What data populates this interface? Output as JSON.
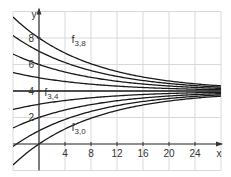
{
  "chart_data": {
    "type": "line",
    "title": "",
    "xlabel": "x",
    "ylabel": "y",
    "xlim": [
      -4,
      28
    ],
    "ylim": [
      -2,
      10
    ],
    "grid": true,
    "x_ticks": [
      4,
      8,
      12,
      16,
      20,
      24
    ],
    "y_ticks": [
      2,
      4,
      6,
      8
    ],
    "function_family": "f_{3,c}(x) = 4 + (c - 4) * exp(-x/12)",
    "series": [
      {
        "name": "f3,0",
        "c": 0
      },
      {
        "name": "f3,1",
        "c": 1
      },
      {
        "name": "f3,2",
        "c": 2
      },
      {
        "name": "f3,3",
        "c": 3
      },
      {
        "name": "f3,4",
        "c": 4
      },
      {
        "name": "f3,5",
        "c": 5
      },
      {
        "name": "f3,6",
        "c": 6
      },
      {
        "name": "f3,7",
        "c": 7
      },
      {
        "name": "f3,8",
        "c": 8
      }
    ],
    "decay": 0.0833,
    "asymptote": 4,
    "annotations": [
      {
        "text": "f",
        "sub": "3,8",
        "x": 5.0,
        "y": 7.6
      },
      {
        "text": "f",
        "sub": "3,4",
        "x": 0.8,
        "y": 3.6
      },
      {
        "text": "f",
        "sub": "3,0",
        "x": 5.0,
        "y": 1.0
      }
    ],
    "colors": {
      "grid": "#d9d9d9",
      "axis": "#333333",
      "curve": "#1a1a1a"
    }
  }
}
